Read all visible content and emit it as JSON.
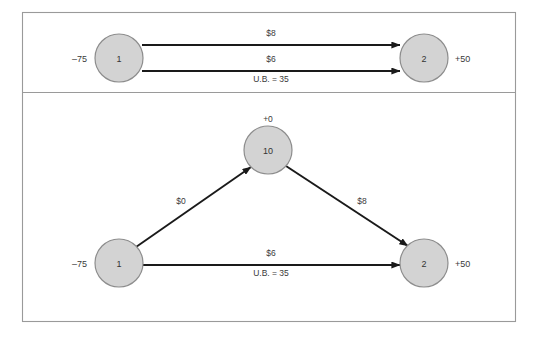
{
  "figure": {
    "background_color": "#ffffff",
    "frame_color": "#9a9a9a",
    "node_fill_color": "#d3d3d3",
    "node_stroke_color": "#8d8d8d",
    "edge_color": "#1a1a1a",
    "text_color": "#3a3a3a"
  },
  "panels": [
    {
      "id": "top-panel",
      "name": "parallel-arcs-panel",
      "nodes": [
        {
          "id": "t1",
          "label": "1",
          "supply": "–75",
          "supply_side": "left",
          "cx": 119,
          "cy": 58,
          "r": 24
        },
        {
          "id": "t2",
          "label": "2",
          "supply": "+50",
          "supply_side": "right",
          "cx": 424,
          "cy": 58,
          "r": 24
        }
      ],
      "edges": [
        {
          "id": "t-edge-upper",
          "name": "edge-1-to-2-upper",
          "from": "t1",
          "to": "t2",
          "cost_label": "$8",
          "bound_label": "",
          "x1": 142,
          "y1": 45,
          "x2": 400,
          "y2": 45
        },
        {
          "id": "t-edge-lower",
          "name": "edge-1-to-2-lower",
          "from": "t1",
          "to": "t2",
          "cost_label": "$6",
          "bound_label": "U.B. = 35",
          "x1": 142,
          "y1": 71,
          "x2": 400,
          "y2": 71
        }
      ]
    },
    {
      "id": "bottom-panel",
      "name": "artificial-node-panel",
      "nodes": [
        {
          "id": "b10",
          "label": "10",
          "supply": "+0",
          "supply_side": "top",
          "cx": 268,
          "cy": 150,
          "r": 24
        },
        {
          "id": "b1",
          "label": "1",
          "supply": "–75",
          "supply_side": "left",
          "cx": 119,
          "cy": 263,
          "r": 24
        },
        {
          "id": "b2",
          "label": "2",
          "supply": "+50",
          "supply_side": "right",
          "cx": 424,
          "cy": 263,
          "r": 24
        }
      ],
      "edges": [
        {
          "id": "b-edge-1-10",
          "name": "edge-1-to-10",
          "from": "b1",
          "to": "b10",
          "cost_label": "$0",
          "bound_label": "",
          "x1": 136,
          "y1": 247,
          "x2": 251,
          "y2": 167
        },
        {
          "id": "b-edge-10-2",
          "name": "edge-10-to-2",
          "from": "b10",
          "to": "b2",
          "cost_label": "$8",
          "bound_label": "",
          "x1": 286,
          "y1": 166,
          "x2": 408,
          "y2": 246
        },
        {
          "id": "b-edge-1-2",
          "name": "edge-1-to-2",
          "from": "b1",
          "to": "b2",
          "cost_label": "$6",
          "bound_label": "U.B. = 35",
          "x1": 143,
          "y1": 265,
          "x2": 400,
          "y2": 265
        }
      ]
    }
  ],
  "labels": {
    "top_upper_cost": "$8",
    "top_lower_cost": "$6",
    "top_lower_bound": "U.B. = 35",
    "bottom_left_cost": "$0",
    "bottom_right_cost": "$8",
    "bottom_horizontal_cost": "$6",
    "bottom_horizontal_bound": "U.B. = 35",
    "node_t1": "1",
    "node_t2": "2",
    "node_b1": "1",
    "node_b2": "2",
    "node_b10": "10",
    "supply_t1": "–75",
    "supply_t2": "+50",
    "supply_b1": "–75",
    "supply_b2": "+50",
    "supply_b10": "+0"
  }
}
